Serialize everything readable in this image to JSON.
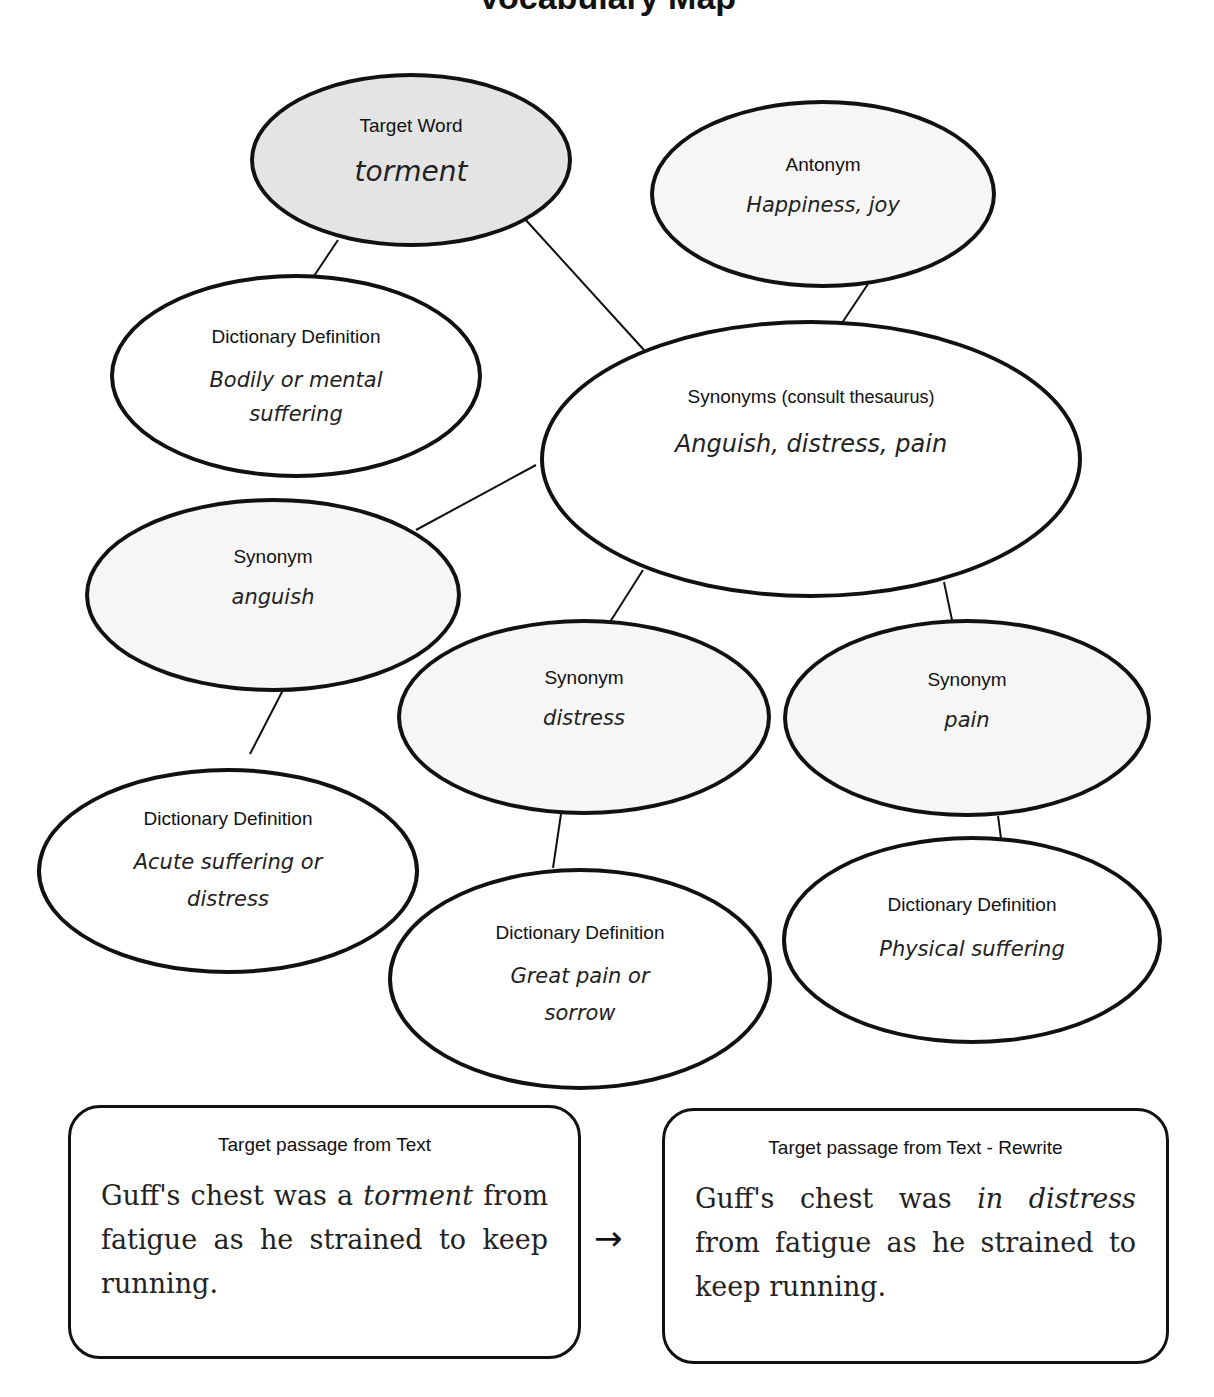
{
  "title": {
    "text": "Vocabulary Map",
    "note": "partially cut off at top edge"
  },
  "nodes": {
    "target_word": {
      "label": "Target Word",
      "value": "torment"
    },
    "antonym": {
      "label": "Antonym",
      "value": "Happiness, joy"
    },
    "definition_target": {
      "label": "Dictionary Definition",
      "value": "Bodily or mental suffering"
    },
    "synonyms": {
      "label_main": "Synonyms",
      "label_note": "(consult thesaurus)",
      "value": "Anguish, distress, pain"
    },
    "synonym_1": {
      "label": "Synonym",
      "value": "anguish"
    },
    "synonym_2": {
      "label": "Synonym",
      "value": "distress"
    },
    "synonym_3": {
      "label": "Synonym",
      "value": "pain"
    },
    "definition_1": {
      "label": "Dictionary Definition",
      "value": "Acute suffering or distress"
    },
    "definition_2": {
      "label": "Dictionary Definition",
      "value": "Great pain or sorrow"
    },
    "definition_3": {
      "label": "Dictionary Definition",
      "value": "Physical suffering"
    }
  },
  "passages": {
    "original": {
      "title": "Target passage from Text",
      "before": "Guff's chest was a ",
      "highlight": "torment",
      "after": " from fatigue as he strained to keep running."
    },
    "rewrite": {
      "title": "Target passage from Text - Rewrite",
      "before": "Guff's chest was ",
      "highlight": "in distress",
      "after": " from fatigue as he strained to keep running."
    },
    "arrow": "→"
  },
  "colors": {
    "target_fill": "#e4e4e4",
    "synonym_fill": "#f6f6f6",
    "stroke": "#111111",
    "background": "#ffffff"
  }
}
